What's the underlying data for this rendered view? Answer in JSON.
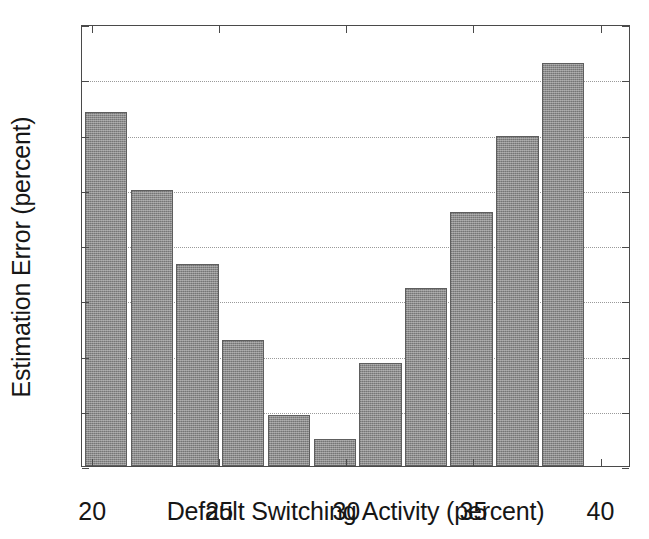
{
  "chart_data": {
    "type": "bar",
    "title": "",
    "xlabel": "Default Switching Activity (percent)",
    "ylabel": "Estimation Error (percent)",
    "xlim": [
      19.6,
      41.2
    ],
    "ylim": [
      0,
      40
    ],
    "grid": true,
    "legend": null,
    "xticks": [
      20,
      25,
      30,
      35,
      40
    ],
    "xtick_labels": [
      "20",
      "25",
      "30",
      "35",
      "40"
    ],
    "yticks": [
      0,
      5,
      10,
      15,
      20,
      25,
      30,
      35,
      40
    ],
    "ytick_labels": [
      "0",
      "5",
      "10",
      "15",
      "20",
      "25",
      "30",
      "35",
      "40"
    ],
    "bar_color": "#8c8c8c",
    "bar_edge_color": "#5e5e5e",
    "x": [
      20.5,
      22.3,
      24.1,
      25.9,
      27.7,
      29.5,
      31.3,
      33.1,
      34.9,
      36.7,
      38.5
    ],
    "values": [
      32.0,
      25.0,
      18.3,
      11.4,
      4.6,
      2.4,
      9.3,
      16.1,
      23.0,
      29.9,
      36.5
    ],
    "categories": [
      "20.5",
      "22.3",
      "24.1",
      "25.9",
      "27.7",
      "29.5",
      "31.3",
      "33.1",
      "34.9",
      "36.7",
      "38.5"
    ],
    "bars": [
      {
        "left_pct": 0.5,
        "width_pct": 7.7,
        "value": 32.0
      },
      {
        "left_pct": 8.9,
        "width_pct": 7.7,
        "value": 25.0
      },
      {
        "left_pct": 17.2,
        "width_pct": 7.7,
        "value": 18.3
      },
      {
        "left_pct": 25.5,
        "width_pct": 7.7,
        "value": 11.4
      },
      {
        "left_pct": 33.8,
        "width_pct": 7.7,
        "value": 4.6
      },
      {
        "left_pct": 42.2,
        "width_pct": 7.7,
        "value": 2.4
      },
      {
        "left_pct": 50.5,
        "width_pct": 7.7,
        "value": 9.3
      },
      {
        "left_pct": 58.8,
        "width_pct": 7.7,
        "value": 16.1
      },
      {
        "left_pct": 67.1,
        "width_pct": 7.7,
        "value": 23.0
      },
      {
        "left_pct": 75.5,
        "width_pct": 7.7,
        "value": 29.9
      },
      {
        "left_pct": 83.8,
        "width_pct": 7.7,
        "value": 36.5
      }
    ]
  }
}
